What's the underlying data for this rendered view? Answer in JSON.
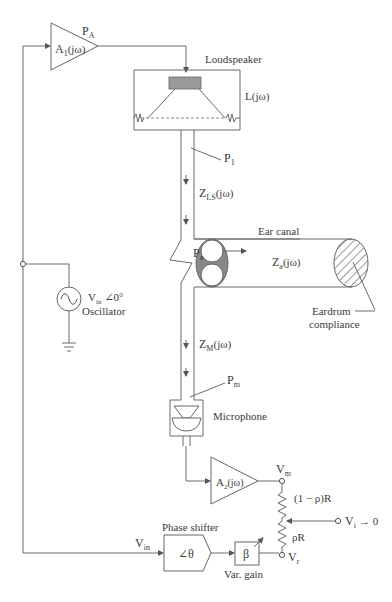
{
  "diagram": {
    "type": "block-schematic",
    "amplifier1": {
      "label": "A",
      "sub": "1",
      "suffix": "(jω)",
      "output_label": "P",
      "output_sub": "A"
    },
    "loudspeaker": {
      "title": "Loudspeaker",
      "transfer": "L(jω)"
    },
    "p1": {
      "label": "P",
      "sub": "1"
    },
    "zls": {
      "label": "Z",
      "sub": "LS",
      "suffix": "(jω)"
    },
    "ear_canal": {
      "title": "Ear canal",
      "impedance_label": "Z",
      "impedance_sub": "a",
      "impedance_suffix": "(jω)"
    },
    "pa": {
      "label": "P",
      "sub": "a"
    },
    "eardrum": {
      "line1": "Eardrum",
      "line2": "compliance"
    },
    "oscillator": {
      "v_label": "V",
      "v_sub": "in",
      "angle": "∠0°",
      "title": "Oscillator"
    },
    "zm": {
      "label": "Z",
      "sub": "M",
      "suffix": "(jω)"
    },
    "pm": {
      "label": "P",
      "sub": "m"
    },
    "microphone": {
      "title": "Microphone"
    },
    "amplifier2": {
      "label": "A",
      "sub": "2",
      "suffix": "(jω)"
    },
    "vm": {
      "label": "V",
      "sub": "m"
    },
    "resistor_top": {
      "label": "(1 − ρ)R"
    },
    "resistor_bottom": {
      "label": "ρR"
    },
    "vi": {
      "label": "V",
      "sub": "i",
      "suffix": "→ 0"
    },
    "vr": {
      "label": "V",
      "sub": "r"
    },
    "vin_line": {
      "label": "V",
      "sub": "in"
    },
    "phase_shifter": {
      "title": "Phase shifter",
      "symbol": "∠θ"
    },
    "var_gain": {
      "symbol": "β",
      "title": "Var. gain"
    }
  }
}
